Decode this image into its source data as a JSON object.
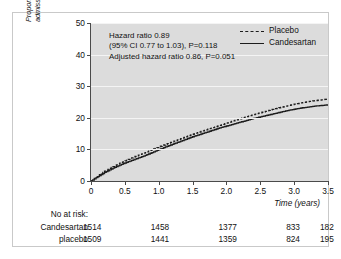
{
  "chart_data": {
    "type": "line",
    "title": "",
    "xlabel": "Time (years)",
    "ylabel_line1": "Proportion with cardiovascular death or hospital",
    "ylabel_line2": "admission for congestive heart failure (%)",
    "xlim": [
      0,
      3.5
    ],
    "ylim": [
      0,
      50
    ],
    "xticks": [
      "0",
      "0.5",
      "1.0",
      "1.5",
      "2.0",
      "2.5",
      "3.0",
      "3.5"
    ],
    "xtick_values": [
      0,
      0.5,
      1.0,
      1.5,
      2.0,
      2.5,
      3.0,
      3.5
    ],
    "yticks": [
      "0",
      "10",
      "20",
      "30",
      "40",
      "50"
    ],
    "ytick_values": [
      0,
      10,
      20,
      30,
      40,
      50
    ],
    "grid": "horizontal-white-on-gray",
    "legend_position": "top-right",
    "series": [
      {
        "name": "Placebo",
        "style": "dashed",
        "color": "#1c1c1c",
        "x": [
          0,
          0.1,
          0.2,
          0.3,
          0.4,
          0.5,
          0.6,
          0.7,
          0.8,
          0.9,
          1.0,
          1.1,
          1.2,
          1.3,
          1.4,
          1.5,
          1.6,
          1.7,
          1.8,
          1.9,
          2.0,
          2.1,
          2.2,
          2.3,
          2.4,
          2.5,
          2.6,
          2.7,
          2.8,
          2.9,
          3.0,
          3.1,
          3.2,
          3.3,
          3.4,
          3.5
        ],
        "y": [
          0,
          1.6,
          3.1,
          4.3,
          5.4,
          6.4,
          7.3,
          8.2,
          9.0,
          9.9,
          10.8,
          11.6,
          12.4,
          13.2,
          14.0,
          14.8,
          15.5,
          16.2,
          16.9,
          17.6,
          18.3,
          19.0,
          19.7,
          20.4,
          21.0,
          21.6,
          22.2,
          22.8,
          23.3,
          23.8,
          24.3,
          24.7,
          25.1,
          25.4,
          25.7,
          26.0
        ]
      },
      {
        "name": "Candesartan",
        "style": "solid",
        "color": "#1c1c1c",
        "x": [
          0,
          0.1,
          0.2,
          0.3,
          0.4,
          0.5,
          0.6,
          0.7,
          0.8,
          0.9,
          1.0,
          1.1,
          1.2,
          1.3,
          1.4,
          1.5,
          1.6,
          1.7,
          1.8,
          1.9,
          2.0,
          2.1,
          2.2,
          2.3,
          2.4,
          2.5,
          2.6,
          2.7,
          2.8,
          2.9,
          3.0,
          3.1,
          3.2,
          3.3,
          3.4,
          3.5
        ],
        "y": [
          0,
          1.4,
          2.7,
          3.8,
          4.8,
          5.7,
          6.5,
          7.3,
          8.1,
          9.0,
          9.9,
          10.8,
          11.6,
          12.4,
          13.2,
          14.0,
          14.7,
          15.4,
          16.1,
          16.8,
          17.4,
          18.0,
          18.6,
          19.2,
          19.8,
          20.3,
          20.8,
          21.3,
          21.8,
          22.3,
          22.7,
          23.1,
          23.4,
          23.7,
          23.9,
          24.1
        ]
      }
    ],
    "annotations": [
      "Hazard ratio 0.89",
      "(95% CI 0.77 to 1.03), P=0.118",
      "Adjusted hazard ratio 0.86, P=0.051"
    ],
    "risk_table": {
      "header": "No at risk:",
      "time_points": [
        0,
        1.0,
        2.0,
        3.0,
        3.5
      ],
      "rows": [
        {
          "label": "Candesartan",
          "values": [
            "1514",
            "1458",
            "1377",
            "833",
            "182"
          ]
        },
        {
          "label": "placebo",
          "values": [
            "1509",
            "1441",
            "1359",
            "824",
            "195"
          ]
        }
      ]
    },
    "colors": {
      "plot_background": "#dcdcdc",
      "gridline": "#f4f4f4",
      "axis": "#4a4a4a",
      "curve": "#1c1c1c",
      "frame": "#c9c9c9",
      "page_background": "#ffffff"
    }
  }
}
